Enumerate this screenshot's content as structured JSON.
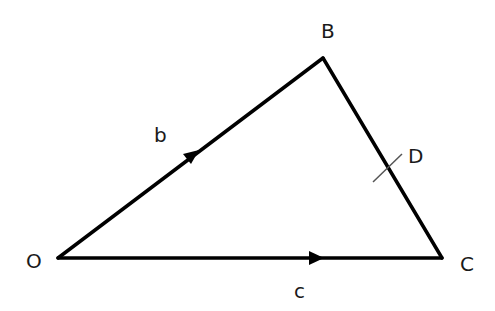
{
  "diagram": {
    "type": "triangle-vectors",
    "vertices": [
      {
        "id": "O",
        "label": "O"
      },
      {
        "id": "B",
        "label": "B"
      },
      {
        "id": "C",
        "label": "C"
      }
    ],
    "edges": [
      {
        "from": "O",
        "to": "B",
        "label": "b",
        "arrow": true
      },
      {
        "from": "O",
        "to": "C",
        "label": "c",
        "arrow": true
      },
      {
        "from": "B",
        "to": "C",
        "label": "",
        "arrow": false
      }
    ],
    "points": [
      {
        "id": "D",
        "label": "D",
        "on_edge": "BC",
        "marked_with_tick": true
      }
    ],
    "line_color": "#000000",
    "tick_color": "#555555"
  }
}
